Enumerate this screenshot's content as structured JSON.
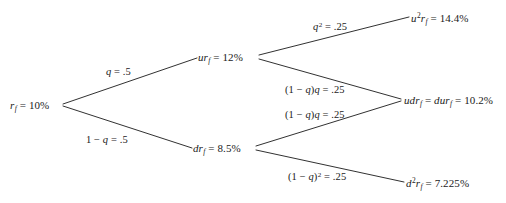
{
  "diagram": {
    "type": "binomial-interest-rate-tree",
    "periods": 2,
    "background_color": "#ffffff",
    "line_color": "#1a1a1a",
    "text_color": "#1a1a1a",
    "nodes": {
      "root": {
        "id": "root",
        "label": "r_f = 10%",
        "value": "10%",
        "x": 62,
        "y": 105
      },
      "up": {
        "id": "u",
        "label": "ur_f = 12%",
        "value": "12%",
        "x": 258,
        "y": 57
      },
      "down": {
        "id": "d",
        "label": "dr_f = 8.5%",
        "value": "8.5%",
        "x": 255,
        "y": 148
      },
      "upup": {
        "id": "uu",
        "label": "u^2 r_f = 14.4%",
        "value": "14.4%",
        "x": 405,
        "y": 17
      },
      "updown": {
        "id": "ud",
        "label": "udr_f = dur_f = 10.2%",
        "value": "10.2%",
        "x": 400,
        "y": 100
      },
      "downdown": {
        "id": "dd",
        "label": "d^2 r_f = 7.225%",
        "value": "7.225%",
        "x": 402,
        "y": 182
      }
    },
    "edges": [
      {
        "from": "root",
        "to": "up",
        "label": "q = .5",
        "probability": 0.5
      },
      {
        "from": "root",
        "to": "down",
        "label": "1 - q = .5",
        "probability": 0.5
      },
      {
        "from": "up",
        "to": "upup",
        "label": "q^2 = .25",
        "probability": 0.25
      },
      {
        "from": "up",
        "to": "updown",
        "label": "(1 - q)q = .25",
        "probability": 0.25
      },
      {
        "from": "down",
        "to": "updown",
        "label": "(1 - q)q = .25",
        "probability": 0.25
      },
      {
        "from": "down",
        "to": "downdown",
        "label": "(1 - q)^2 = .25",
        "probability": 0.25
      }
    ]
  }
}
